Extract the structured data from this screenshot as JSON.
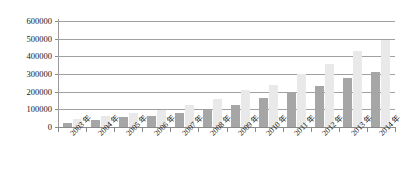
{
  "chart_data": {
    "type": "bar",
    "title": "",
    "subtitle": "",
    "xlabel": "",
    "ylabel": "",
    "grid": true,
    "legend": false,
    "legend_position": "none",
    "orientation": "vertical",
    "grouping": "clustered",
    "ylim": [
      0,
      600000
    ],
    "ytick_labels": [
      "600000",
      "500000",
      "400000",
      "300000",
      "200000",
      "100000",
      "0"
    ],
    "ytick_values": [
      600000,
      500000,
      400000,
      300000,
      200000,
      100000,
      0
    ],
    "categories": [
      "2003 年",
      "2004 年",
      "2005 年",
      "2006 年",
      "2007 年",
      "2008 年",
      "2009 年",
      "2010 年",
      "2011 年",
      "2012 年",
      "2013 年",
      "2014 年"
    ],
    "series": [
      {
        "name": "series-1",
        "color": "#a6a6a6",
        "values": [
          20000,
          42000,
          55000,
          62000,
          78000,
          95000,
          125000,
          163000,
          198000,
          232000,
          278000,
          310000
        ]
      },
      {
        "name": "series-2",
        "color": "#e9e9e9",
        "values": [
          48000,
          62000,
          80000,
          98000,
          127000,
          158000,
          208000,
          238000,
          298000,
          358000,
          432000,
          490000
        ]
      }
    ]
  }
}
